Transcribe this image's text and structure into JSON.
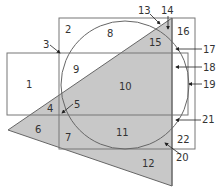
{
  "diagram": {
    "type": "venn-like region diagram",
    "colors": {
      "line": "#666666",
      "shade": "#c8c8c8",
      "text": "#333333"
    },
    "regions": [
      {
        "id": "1",
        "label": "1"
      },
      {
        "id": "2",
        "label": "2"
      },
      {
        "id": "3",
        "label": "3"
      },
      {
        "id": "4",
        "label": "4"
      },
      {
        "id": "5",
        "label": "5"
      },
      {
        "id": "6",
        "label": "6"
      },
      {
        "id": "7",
        "label": "7"
      },
      {
        "id": "8",
        "label": "8"
      },
      {
        "id": "9",
        "label": "9"
      },
      {
        "id": "10",
        "label": "10"
      },
      {
        "id": "11",
        "label": "11"
      },
      {
        "id": "12",
        "label": "12"
      },
      {
        "id": "13",
        "label": "13"
      },
      {
        "id": "14",
        "label": "14"
      },
      {
        "id": "15",
        "label": "15"
      },
      {
        "id": "16",
        "label": "16"
      },
      {
        "id": "17",
        "label": "17"
      },
      {
        "id": "18",
        "label": "18"
      },
      {
        "id": "19",
        "label": "19"
      },
      {
        "id": "20",
        "label": "20"
      },
      {
        "id": "21",
        "label": "21"
      },
      {
        "id": "22",
        "label": "22"
      }
    ]
  }
}
